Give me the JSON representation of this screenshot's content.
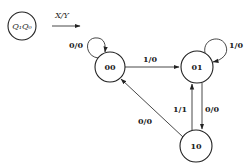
{
  "diagram": {
    "type": "state-transition-diagram",
    "legend": {
      "state_label": "Q₁Q₀",
      "transition_label": "X/Y"
    },
    "states": [
      {
        "id": "00",
        "label": "00"
      },
      {
        "id": "01",
        "label": "01"
      },
      {
        "id": "10",
        "label": "10"
      }
    ],
    "transitions": [
      {
        "from": "00",
        "to": "00",
        "label": "0/0"
      },
      {
        "from": "00",
        "to": "01",
        "label": "1/0"
      },
      {
        "from": "01",
        "to": "01",
        "label": "1/0"
      },
      {
        "from": "01",
        "to": "10",
        "label": "0/0"
      },
      {
        "from": "10",
        "to": "01",
        "label": "1/1"
      },
      {
        "from": "10",
        "to": "00",
        "label": "0/0"
      }
    ],
    "colors": {
      "stroke": "#222222",
      "background": "#ffffff"
    }
  }
}
